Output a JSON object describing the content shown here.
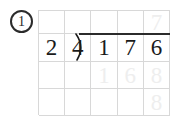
{
  "worksheet": {
    "problem_number": "1",
    "problem_type": "long-division",
    "expression": "24)176",
    "divisor": "24",
    "dividend": "176",
    "ink_color": "#1a1a1a",
    "ghost_color": "#eeeeee",
    "grid_line_color": "#d8d8d8",
    "background_color": "#ffffff"
  },
  "grid": {
    "columns": 5,
    "rows": 4,
    "cells": [
      [
        {
          "text": "",
          "style": "empty"
        },
        {
          "text": "",
          "style": "empty"
        },
        {
          "text": "",
          "style": "empty"
        },
        {
          "text": "",
          "style": "empty"
        },
        {
          "text": "7",
          "style": "ghost"
        }
      ],
      [
        {
          "text": "2",
          "style": "ink"
        },
        {
          "text": "4",
          "style": "ink"
        },
        {
          "text": "1",
          "style": "ink"
        },
        {
          "text": "7",
          "style": "ink"
        },
        {
          "text": "6",
          "style": "ink"
        }
      ],
      [
        {
          "text": "",
          "style": "empty"
        },
        {
          "text": "",
          "style": "empty"
        },
        {
          "text": "1",
          "style": "ghost"
        },
        {
          "text": "6",
          "style": "ghost"
        },
        {
          "text": "8",
          "style": "ghost"
        }
      ],
      [
        {
          "text": "",
          "style": "empty"
        },
        {
          "text": "",
          "style": "empty"
        },
        {
          "text": "",
          "style": "empty"
        },
        {
          "text": "",
          "style": "empty"
        },
        {
          "text": "8",
          "style": "ghost"
        }
      ]
    ]
  }
}
